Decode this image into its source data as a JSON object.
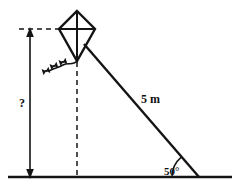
{
  "figure": {
    "kind": "geometry-diagram",
    "background_color": "#ffffff",
    "ink_color": "#141414"
  },
  "labels": {
    "hypotenuse_length": "5 m",
    "ground_angle": "50°",
    "unknown_height": "?"
  },
  "diagram_data": {
    "type": "right-triangle",
    "description": "A kite on a 5 m string makes a 50 degree angle with the ground; the unknown vertical height is marked with a question mark.",
    "known": [
      {
        "name": "string-length",
        "value": "5 m",
        "role": "hypotenuse"
      },
      {
        "name": "elevation-angle",
        "value": "50°",
        "role": "angle-at-ground"
      }
    ],
    "unknown": [
      {
        "name": "kite-height",
        "value": "?",
        "role": "opposite-side"
      }
    ],
    "elements": [
      "kite",
      "kite-tail",
      "kite-string",
      "ground-line",
      "height-dimension-arrow",
      "vertical-dashed-drop-line",
      "horizontal-dashed-top-line",
      "angle-arc"
    ]
  },
  "geometry": {
    "kite": {
      "top": {
        "x": 77,
        "y": 11
      },
      "left": {
        "x": 59,
        "y": 29
      },
      "right": {
        "x": 95,
        "y": 29
      },
      "bottom": {
        "x": 77,
        "y": 61
      }
    },
    "ground": {
      "x1": 8,
      "y": 177,
      "x2": 232
    },
    "string": {
      "x1": 84,
      "y1": 46,
      "x2": 198,
      "y2": 177
    },
    "dimension_line": {
      "x": 30,
      "y_top": 29,
      "y_bottom": 177
    },
    "drop_line": {
      "x": 77,
      "y_top": 61,
      "y_bottom": 177
    },
    "top_dash_line": {
      "x1": 20,
      "x2": 62,
      "y": 29
    },
    "angle_arc": {
      "cx": 198,
      "cy": 177,
      "r": 26,
      "degrees": 50
    }
  }
}
